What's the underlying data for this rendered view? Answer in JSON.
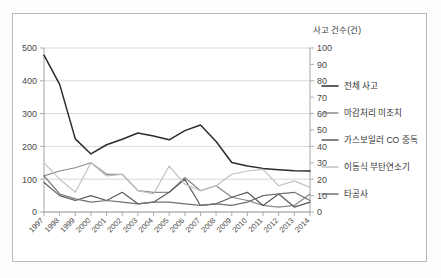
{
  "figure": {
    "secondary_axis_title": "사고 건수(건)",
    "frame_visible": true
  },
  "chart_data": {
    "type": "line",
    "title": "",
    "subtitle": "",
    "xlabel": "",
    "ylabel": "",
    "secondary_ylabel": "사고 건수(건)",
    "grid": true,
    "legend_position": "right",
    "x": [
      "1997",
      "1998",
      "1999",
      "2000",
      "2001",
      "2002",
      "2003",
      "2004",
      "2005",
      "2006",
      "2007",
      "2008",
      "2009",
      "2010",
      "2011",
      "2012",
      "2013",
      "2014"
    ],
    "categories": [
      "1997",
      "1998",
      "1999",
      "2000",
      "2001",
      "2002",
      "2003",
      "2004",
      "2005",
      "2006",
      "2007",
      "2008",
      "2009",
      "2010",
      "2011",
      "2012",
      "2013",
      "2014"
    ],
    "ylim": [
      0,
      500
    ],
    "yticks": [
      0,
      100,
      200,
      300,
      400,
      500
    ],
    "secondary_ylim": [
      0,
      100
    ],
    "secondary_yticks": [
      0,
      10,
      20,
      30,
      40,
      50,
      60,
      70,
      80,
      90,
      100
    ],
    "series": [
      {
        "name": "전체 사고",
        "axis": "left",
        "color": "#2b2b2b",
        "width": 1.5,
        "values": [
          478,
          389,
          223,
          177,
          205,
          222,
          241,
          232,
          220,
          248,
          265,
          215,
          151,
          140,
          133,
          129,
          126,
          125
        ]
      },
      {
        "name": "마감처리 미조치",
        "axis": "right",
        "color": "#8a8a8a",
        "width": 1.2,
        "values": [
          22,
          25,
          27,
          30,
          23,
          23,
          13,
          12,
          12,
          21,
          13,
          16,
          9,
          7,
          4,
          3,
          4,
          11
        ]
      },
      {
        "name": "가스보일러 CO 중독",
        "axis": "right",
        "color": "#5b5b5b",
        "width": 1.2,
        "values": [
          18,
          10,
          7,
          10,
          7,
          12,
          5,
          6,
          12,
          20,
          4,
          5,
          9,
          12,
          4,
          11,
          3,
          6
        ]
      },
      {
        "name": "이동식 부탄연소기",
        "axis": "right",
        "color": "#c2c2c2",
        "width": 1.2,
        "values": [
          30,
          20,
          12,
          30,
          22,
          23,
          13,
          11,
          28,
          17,
          13,
          16,
          23,
          25,
          26,
          16,
          19,
          15
        ]
      },
      {
        "name": "타공사",
        "axis": "right",
        "color": "#707070",
        "width": 1.2,
        "values": [
          22,
          11,
          8,
          6,
          7,
          6,
          5,
          6,
          6,
          5,
          4,
          5,
          4,
          6,
          10,
          11,
          12,
          7
        ]
      }
    ]
  },
  "legend": {
    "entries": [
      {
        "label": "전체 사고",
        "color": "#2b2b2b"
      },
      {
        "label": "마감처리 미조치",
        "color": "#8a8a8a"
      },
      {
        "label": "가스보일러 CO 중독",
        "color": "#5b5b5b"
      },
      {
        "label": "이동식 부탄연소기",
        "color": "#c2c2c2"
      },
      {
        "label": "타공사",
        "color": "#707070"
      }
    ]
  },
  "colors": {
    "grid": "#c8c8c8",
    "axis": "#9a9a9a",
    "frame": "#b9b9b9",
    "text": "#4a4a4a",
    "background": "#ffffff"
  }
}
